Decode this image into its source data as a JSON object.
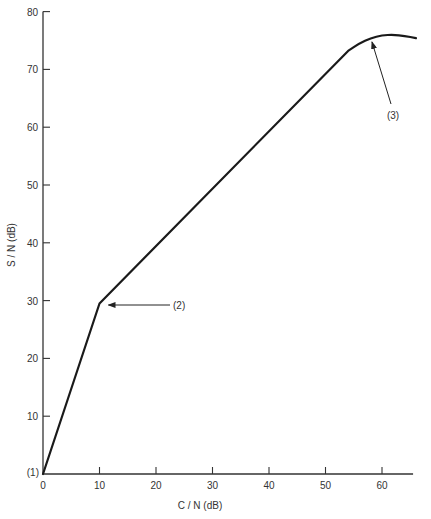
{
  "chart_data": {
    "type": "line",
    "title": "",
    "xlabel": "C / N (dB)",
    "ylabel": "S / N (dB)",
    "xlim": [
      0,
      65.5
    ],
    "ylim": [
      0,
      80
    ],
    "x_ticks": [
      0,
      10,
      20,
      30,
      40,
      50,
      60
    ],
    "y_ticks": [
      10,
      20,
      30,
      40,
      50,
      60,
      70,
      80
    ],
    "grid": false,
    "legend": null,
    "series": [
      {
        "name": "S/N vs C/N",
        "x": [
          0,
          10,
          54,
          56,
          58,
          60,
          62,
          64,
          66
        ],
        "y": [
          0,
          29.5,
          73.2,
          74.5,
          75.4,
          75.9,
          76.0,
          75.8,
          75.4
        ]
      }
    ],
    "annotations": [
      {
        "label": "(1)",
        "x": 0,
        "y": 0,
        "note": "origin marker"
      },
      {
        "label": "(2)",
        "x": 10,
        "y": 29.5,
        "note": "arrow pointing to slope break"
      },
      {
        "label": "(3)",
        "x": 59,
        "y": 75.5,
        "note": "arrow pointing to curve near peak"
      }
    ],
    "line_color": "#1a1a1a"
  }
}
